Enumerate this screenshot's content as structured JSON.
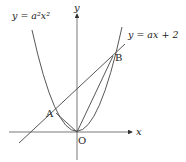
{
  "diagram": {
    "type": "function-graph",
    "axes": {
      "x_label": "x",
      "y_label": "y",
      "origin_label": "O"
    },
    "curves": [
      {
        "id": "parabola",
        "equation_label": "y = a²x²"
      },
      {
        "id": "line",
        "equation_label": "y = ax + 2"
      }
    ],
    "points": [
      {
        "label": "A"
      },
      {
        "label": "B"
      },
      {
        "label": "O"
      }
    ],
    "segments": [
      "OA",
      "OB"
    ],
    "colors": {
      "stroke": "#333333",
      "background": "#ffffff"
    }
  }
}
